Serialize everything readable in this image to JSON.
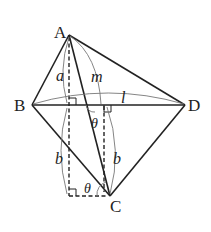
{
  "figure": {
    "points": {
      "A": {
        "label": "A",
        "x": 69,
        "y": 35
      },
      "B": {
        "label": "B",
        "x": 32,
        "y": 105
      },
      "C": {
        "label": "C",
        "x": 110,
        "y": 196
      },
      "D": {
        "label": "D",
        "x": 185,
        "y": 105
      }
    },
    "labels": {
      "a": "a",
      "m": "m",
      "l": "l",
      "b_left": "b",
      "b_right": "b",
      "theta_top": "θ",
      "theta_bottom": "θ"
    },
    "colors": {
      "line": "#222222",
      "arc": "#777777",
      "background": "#ffffff"
    }
  }
}
